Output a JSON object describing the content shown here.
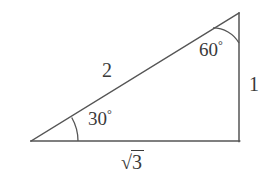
{
  "figure": {
    "background_color": "#ffffff",
    "stroke_color": "#555555",
    "text_color": "#3a3a3a",
    "labels": {
      "hypotenuse": "2",
      "vertical_side": "1",
      "base_side_sqrt_symbol": "√",
      "base_side_radicand": "3",
      "angle_left": "30",
      "angle_left_degree": "°",
      "angle_top": "60",
      "angle_top_degree": "°"
    },
    "geometry": {
      "vertex_left": [
        31,
        141
      ],
      "vertex_bottom_right": [
        239,
        141
      ],
      "vertex_apex": [
        239,
        13
      ],
      "arc_left_radius": 47,
      "arc_top_radius": 30,
      "stroke_width": 1.3
    }
  }
}
